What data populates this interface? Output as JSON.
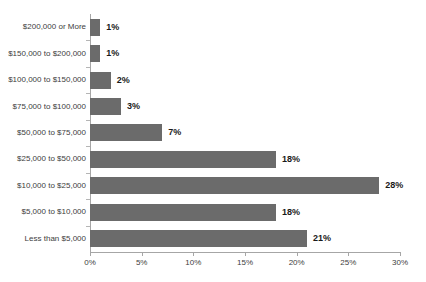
{
  "chart_data": {
    "type": "bar",
    "orientation": "horizontal",
    "title": "",
    "subtitle": "",
    "xlabel": "",
    "ylabel": "",
    "xlim": [
      0,
      30
    ],
    "grid": false,
    "legend": null,
    "bar_color": "#6b6b6b",
    "axis_color": "#a6a6a6",
    "label_color": "#3d3d3d",
    "value_label_color": "#1a1a1a",
    "categories": [
      "$200,000 or More",
      "$150,000 to $200,000",
      "$100,000 to $150,000",
      "$75,000 to $100,000",
      "$50,000 to $75,000",
      "$25,000 to $50,000",
      "$10,000 to $25,000",
      "$5,000 to $10,000",
      "Less than $5,000"
    ],
    "values": [
      1,
      1,
      2,
      3,
      7,
      18,
      28,
      18,
      21
    ],
    "value_labels": [
      "1%",
      "1%",
      "2%",
      "3%",
      "7%",
      "18%",
      "28%",
      "18%",
      "21%"
    ],
    "xticks": [
      0,
      5,
      10,
      15,
      20,
      25,
      30
    ],
    "xtick_labels": [
      "0%",
      "5%",
      "10%",
      "15%",
      "20%",
      "25%",
      "30%"
    ]
  }
}
